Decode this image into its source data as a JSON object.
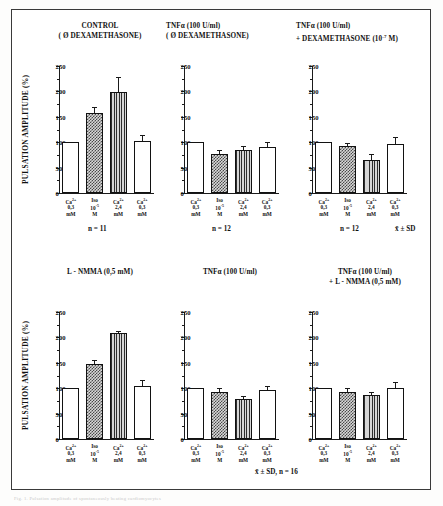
{
  "figure": {
    "y_axis_label": "PULSATION AMPLITUDE (%)",
    "y_ticks": [
      "0",
      "50",
      "100",
      "150",
      "200",
      "250"
    ],
    "y_min": 0,
    "y_max": 250,
    "stats_note_top": "x̄ ± SD",
    "stats_note_bottom": "x̄ ± SD, n = 16",
    "undertext": "Fig. 1. Pulsation amplitude of spontaneously beating cardiomyocytes"
  },
  "chart_data": [
    {
      "type": "bar",
      "id": "panel-control",
      "title_lines": [
        "CONTROL",
        "( Ø DEXAMETHASONE)"
      ],
      "n_label": "n = 11",
      "ylabel": "PULSATION AMPLITUDE (%)",
      "xlabel": "",
      "ylim": [
        0,
        250
      ],
      "categories": [
        "Ca2+ 0,3 mM",
        "Iso 10-5 M",
        "Ca2+ 2,4 mM",
        "Ca2+ 0,3 mM"
      ],
      "category_labels": [
        {
          "l1": "Ca",
          "sup": "2+",
          "l2": "0,3",
          "l3": "mM"
        },
        {
          "l1": "Iso",
          "sup": "",
          "l2": "10-5",
          "l3": "M"
        },
        {
          "l1": "Ca",
          "sup": "2+",
          "l2": "2,4",
          "l3": "mM"
        },
        {
          "l1": "Ca",
          "sup": "2+",
          "l2": "0,3",
          "l3": "mM"
        }
      ],
      "values": [
        100,
        158,
        198,
        102
      ],
      "errors": [
        0,
        12,
        30,
        13
      ],
      "patterns": [
        "white",
        "checker",
        "vline",
        "white"
      ]
    },
    {
      "type": "bar",
      "id": "panel-tnf-nodex",
      "title_lines": [
        "TNFα (100 U/ml)",
        "( Ø DEXAMETHASONE)"
      ],
      "n_label": "n = 12",
      "ylabel": "",
      "xlabel": "",
      "ylim": [
        0,
        250
      ],
      "categories": [
        "Ca2+ 0,3 mM",
        "Iso 10-5 M",
        "Ca2+ 2,4 mM",
        "Ca2+ 0,3 mM"
      ],
      "category_labels": [
        {
          "l1": "Ca",
          "sup": "2+",
          "l2": "0,3",
          "l3": "mM"
        },
        {
          "l1": "Iso",
          "sup": "",
          "l2": "10-5",
          "l3": "M"
        },
        {
          "l1": "Ca",
          "sup": "2+",
          "l2": "2,4",
          "l3": "mM"
        },
        {
          "l1": "Ca",
          "sup": "2+",
          "l2": "0,3",
          "l3": "mM"
        }
      ],
      "values": [
        100,
        76,
        84,
        91
      ],
      "errors": [
        0,
        9,
        9,
        10
      ],
      "patterns": [
        "white",
        "checker",
        "vline",
        "white"
      ]
    },
    {
      "type": "bar",
      "id": "panel-tnf-dex",
      "title_lines": [
        "TNFα (100 U/ml)",
        "+ DEXAMETHASONE (10-7 M)"
      ],
      "n_label": "n = 12",
      "ylabel": "",
      "xlabel": "",
      "ylim": [
        0,
        250
      ],
      "categories": [
        "Ca2+ 0,3 mM",
        "Iso 10-5 M",
        "Ca2+ 2,4 mM",
        "Ca2+ 0,3 mM"
      ],
      "category_labels": [
        {
          "l1": "Ca",
          "sup": "2+",
          "l2": "0,3",
          "l3": "mM"
        },
        {
          "l1": "Iso",
          "sup": "",
          "l2": "10-5",
          "l3": "M"
        },
        {
          "l1": "Ca",
          "sup": "2+",
          "l2": "2,4",
          "l3": "mM"
        },
        {
          "l1": "Ca",
          "sup": "2+",
          "l2": "0,3",
          "l3": "mM"
        }
      ],
      "values": [
        100,
        92,
        65,
        96
      ],
      "errors": [
        0,
        7,
        12,
        14
      ],
      "patterns": [
        "white",
        "checker",
        "vline",
        "white"
      ]
    },
    {
      "type": "bar",
      "id": "panel-lnmma",
      "title_lines": [
        "L - NMMA (0,5 mM)"
      ],
      "n_label": "",
      "ylabel": "PULSATION AMPLITUDE (%)",
      "xlabel": "",
      "ylim": [
        0,
        250
      ],
      "categories": [
        "Ca2+ 0,3 mM",
        "Iso 10-5 M",
        "Ca2+ 2,4 mM",
        "Ca2+ 0,3 mM"
      ],
      "category_labels": [
        {
          "l1": "Ca",
          "sup": "2+",
          "l2": "0,3",
          "l3": "mM"
        },
        {
          "l1": "Iso",
          "sup": "",
          "l2": "10-5",
          "l3": "M"
        },
        {
          "l1": "Ca",
          "sup": "2+",
          "l2": "2,4",
          "l3": "mM"
        },
        {
          "l1": "Ca",
          "sup": "2+",
          "l2": "0,3",
          "l3": "mM"
        }
      ],
      "values": [
        100,
        148,
        209,
        105
      ],
      "errors": [
        0,
        8,
        3,
        11
      ],
      "patterns": [
        "white",
        "checker",
        "vline",
        "white"
      ]
    },
    {
      "type": "bar",
      "id": "panel-tnf-alone",
      "title_lines": [
        "TNFα (100 U/ml)"
      ],
      "n_label": "",
      "ylabel": "",
      "xlabel": "",
      "ylim": [
        0,
        250
      ],
      "categories": [
        "Ca2+ 0,3 mM",
        "Iso 10-5 M",
        "Ca2+ 2,4 mM",
        "Ca2+ 0,3 mM"
      ],
      "category_labels": [
        {
          "l1": "Ca",
          "sup": "2+",
          "l2": "0,3",
          "l3": "mM"
        },
        {
          "l1": "Iso",
          "sup": "",
          "l2": "10-5",
          "l3": "M"
        },
        {
          "l1": "Ca",
          "sup": "2+",
          "l2": "2,4",
          "l3": "mM"
        },
        {
          "l1": "Ca",
          "sup": "2+",
          "l2": "0,3",
          "l3": "mM"
        }
      ],
      "values": [
        100,
        92,
        78,
        96
      ],
      "errors": [
        0,
        8,
        6,
        8
      ],
      "patterns": [
        "white",
        "checker",
        "vline",
        "white"
      ]
    },
    {
      "type": "bar",
      "id": "panel-tnf-lnmma",
      "title_lines": [
        "TNFα (100 U/ml)",
        "+ L - NMMA (0,5 mM)"
      ],
      "n_label": "",
      "ylabel": "",
      "xlabel": "",
      "ylim": [
        0,
        250
      ],
      "categories": [
        "Ca2+ 0,3 mM",
        "Iso 10-5 M",
        "Ca2+ 2,4 mM",
        "Ca2+ 0,3 mM"
      ],
      "category_labels": [
        {
          "l1": "Ca",
          "sup": "2+",
          "l2": "0,3",
          "l3": "mM"
        },
        {
          "l1": "Iso",
          "sup": "",
          "l2": "10-5",
          "l3": "M"
        },
        {
          "l1": "Ca",
          "sup": "2+",
          "l2": "2,4",
          "l3": "mM"
        },
        {
          "l1": "Ca",
          "sup": "2+",
          "l2": "0,3",
          "l3": "mM"
        }
      ],
      "values": [
        100,
        92,
        86,
        101
      ],
      "errors": [
        0,
        9,
        7,
        11
      ],
      "patterns": [
        "white",
        "checker",
        "vline",
        "white"
      ]
    }
  ]
}
